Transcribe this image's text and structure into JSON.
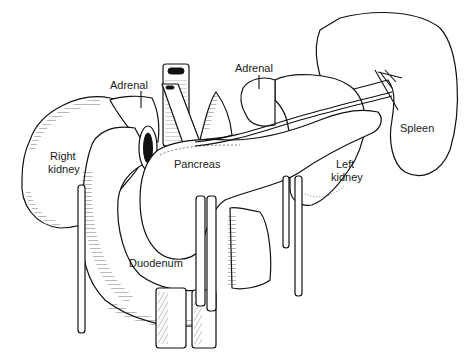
{
  "figure": {
    "type": "anatomical line drawing",
    "labels": {
      "adrenal_right": "Adrenal",
      "adrenal_left": "Adrenal",
      "right_kidney_line1": "Right",
      "right_kidney_line2": "kidney",
      "pancreas": "Pancreas",
      "left_kidney_line1": "Left",
      "left_kidney_line2": "kidney",
      "spleen": "Spleen",
      "duodenum": "Duodenum"
    },
    "colors": {
      "line": "#111111",
      "background": "#ffffff"
    }
  }
}
